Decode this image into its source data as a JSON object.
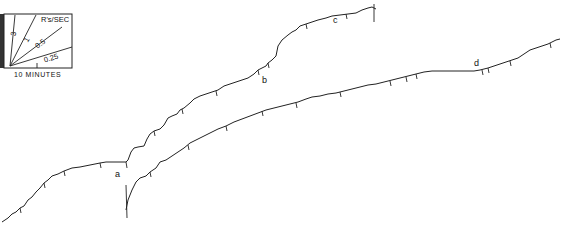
{
  "figure": {
    "type": "cumulative-record",
    "legend": {
      "title": "R's/SEC",
      "rate_labels": [
        "3",
        "1",
        "0.5",
        "0.25"
      ],
      "time_scale_label": "10 MINUTES"
    },
    "segment_labels": [
      "a",
      "b",
      "c",
      "d"
    ],
    "colors": {
      "ink": "#222222",
      "background": "#ffffff",
      "legend_shade": "#333333"
    }
  }
}
